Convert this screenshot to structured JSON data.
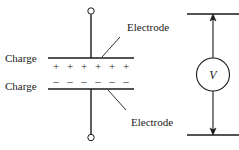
{
  "figure": {
    "type": "schematic-diagram",
    "background_color": "#ffffff",
    "line_color": "#1a1a1a"
  },
  "labels": {
    "electrode_top": "Electrode",
    "electrode_bottom": "Electrode",
    "charge_positive": "Charge",
    "charge_negative": "Charge",
    "voltmeter": "V"
  },
  "charges": {
    "positive_symbol": "+",
    "positive_count": 6,
    "negative_symbol": "–",
    "negative_count": 6
  },
  "parts": {
    "top_terminal": "open-circle-terminal",
    "bottom_terminal": "open-circle-terminal",
    "top_plate": "electrode-plate-line",
    "bottom_plate": "electrode-plate-line",
    "lead_top": "vertical-lead",
    "lead_bottom": "vertical-lead",
    "meter_body": "circle",
    "arrow_up": "arrowhead-up",
    "arrow_down": "arrowhead-down",
    "rail_top": "horizontal-rail",
    "rail_bottom": "horizontal-rail",
    "leader_top": "leader-line",
    "leader_bottom": "leader-line"
  }
}
